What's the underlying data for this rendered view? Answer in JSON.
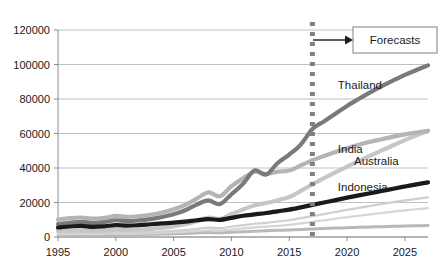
{
  "chart_data": {
    "type": "line",
    "title": "",
    "xlabel": "",
    "ylabel": "",
    "xlim": [
      1995,
      2027
    ],
    "ylim": [
      0,
      120000
    ],
    "grid": true,
    "legend_position": "inline-series-labels",
    "y_ticks": [
      "0",
      "20000",
      "40000",
      "60000",
      "80000",
      "100000",
      "120000"
    ],
    "y_tick_values": [
      0,
      20000,
      40000,
      60000,
      80000,
      100000,
      120000
    ],
    "x_ticks": [
      "1995",
      "2000",
      "2005",
      "2010",
      "2015",
      "2020",
      "2025"
    ],
    "x_tick_values": [
      1995,
      2000,
      2005,
      2010,
      2015,
      2020,
      2025
    ],
    "x": [
      1995,
      1996,
      1997,
      1998,
      1999,
      2000,
      2001,
      2002,
      2003,
      2004,
      2005,
      2006,
      2007,
      2008,
      2009,
      2010,
      2011,
      2012,
      2013,
      2014,
      2015,
      2016,
      2017,
      2018,
      2019,
      2020,
      2021,
      2022,
      2023,
      2024,
      2025,
      2026,
      2027
    ],
    "forecast_start": 2017,
    "annotations": [
      {
        "name": "forecast-divider",
        "type": "vertical-dotted-line",
        "x": 2017,
        "color": "#808080"
      },
      {
        "name": "forecasts-callout",
        "type": "box-with-arrow",
        "label": "Forecasts",
        "color": "#808080"
      }
    ],
    "series": [
      {
        "name": "Thailand",
        "color": "#7a7a7a",
        "width": 4.2,
        "label_x": 2019.2,
        "label_y": 86000,
        "values": [
          7500,
          8200,
          8800,
          8100,
          8600,
          9700,
          9200,
          9600,
          10400,
          11600,
          13200,
          15500,
          18800,
          21200,
          19100,
          24800,
          30800,
          38600,
          36200,
          42900,
          47800,
          53600,
          62600,
          67000,
          71500,
          76000,
          80000,
          83800,
          87400,
          90800,
          94000,
          96800,
          99500
        ]
      },
      {
        "name": "India",
        "color": "#b4b4b4",
        "width": 4.2,
        "label_x": 2019.2,
        "label_y": 48500,
        "values": [
          10100,
          10900,
          11300,
          10600,
          11100,
          12200,
          11700,
          12100,
          12900,
          14200,
          16100,
          18600,
          22200,
          25900,
          23600,
          29400,
          34000,
          37800,
          36400,
          37900,
          38500,
          41500,
          44500,
          47000,
          49300,
          51500,
          53500,
          55200,
          56700,
          58200,
          59500,
          60600,
          61600
        ]
      },
      {
        "name": "Australia",
        "color": "#c6c6c6",
        "width": 4.2,
        "label_x": 2020.6,
        "label_y": 41500,
        "values": [
          3400,
          3700,
          3900,
          3600,
          3800,
          4200,
          4100,
          4300,
          4700,
          5300,
          6200,
          7400,
          9200,
          11300,
          10400,
          13300,
          15900,
          18400,
          19700,
          21300,
          23200,
          26700,
          30500,
          34100,
          37500,
          40800,
          44000,
          47200,
          50200,
          53200,
          56200,
          58900,
          61500
        ]
      },
      {
        "name": "Indonesia",
        "color": "#1a1a1a",
        "width": 4.2,
        "label_x": 2019.2,
        "label_y": 26500,
        "values": [
          5500,
          6100,
          6500,
          5900,
          6200,
          6900,
          6600,
          6900,
          7400,
          7900,
          8300,
          8900,
          9700,
          10400,
          9900,
          11100,
          12300,
          13100,
          13900,
          14900,
          15900,
          17200,
          18600,
          20000,
          21400,
          22800,
          24100,
          25400,
          26700,
          28000,
          29300,
          30500,
          31700
        ]
      },
      {
        "name": "",
        "color": "#cfcfcf",
        "width": 2.2,
        "label_x": null,
        "label_y": null,
        "values": [
          2200,
          2400,
          2500,
          2300,
          2400,
          2700,
          2600,
          2700,
          2900,
          3200,
          3600,
          4100,
          4800,
          5400,
          5100,
          6000,
          6900,
          7700,
          8200,
          9000,
          9700,
          10900,
          12100,
          13300,
          14500,
          15700,
          16900,
          18000,
          19100,
          20200,
          21200,
          22100,
          23000
        ]
      },
      {
        "name": "",
        "color": "#d6d6d6",
        "width": 2.2,
        "label_x": null,
        "label_y": null,
        "values": [
          1600,
          1700,
          1800,
          1700,
          1800,
          2000,
          1900,
          2000,
          2200,
          2400,
          2700,
          3000,
          3500,
          3900,
          3700,
          4300,
          5000,
          5600,
          6000,
          6500,
          7000,
          7900,
          8800,
          9700,
          10600,
          11500,
          12300,
          13100,
          13900,
          14700,
          15400,
          16100,
          16700
        ]
      },
      {
        "name": "",
        "color": "#b9b9b9",
        "width": 3.0,
        "label_x": null,
        "label_y": null,
        "values": [
          1200,
          1300,
          1350,
          1250,
          1300,
          1450,
          1400,
          1450,
          1550,
          1700,
          1850,
          2050,
          2300,
          2550,
          2400,
          2750,
          3100,
          3400,
          3600,
          3850,
          4050,
          4350,
          4650,
          4900,
          5150,
          5400,
          5600,
          5800,
          6000,
          6200,
          6350,
          6500,
          6650
        ]
      }
    ]
  },
  "labels": {
    "thailand": "Thailand",
    "india": "India",
    "australia": "Australia",
    "indonesia": "Indonesia",
    "forecasts": "Forecasts"
  }
}
